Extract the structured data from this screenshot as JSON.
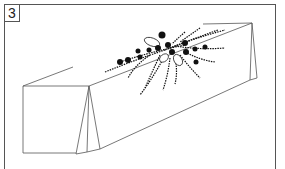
{
  "figure": {
    "step_number": "3",
    "illustration": "draped-table-with-floral-arrangement-icon",
    "colors": {
      "line": "#555555",
      "ink": "#111111",
      "background": "#ffffff"
    }
  }
}
